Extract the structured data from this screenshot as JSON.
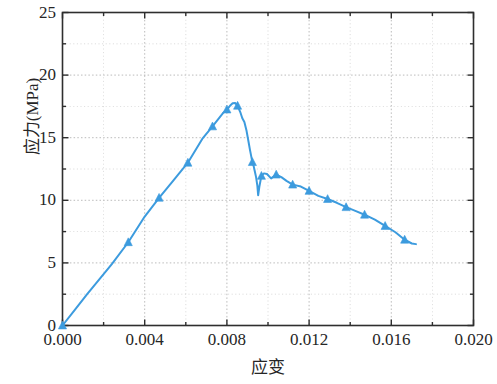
{
  "chart_data": {
    "type": "line",
    "title": "",
    "xlabel": "应变",
    "ylabel": "应力(MPa)",
    "xlim": [
      0.0,
      0.02
    ],
    "ylim": [
      0,
      25
    ],
    "xticks": [
      "0.000",
      "0.004",
      "0.008",
      "0.012",
      "0.016",
      "0.020"
    ],
    "xtick_values": [
      0.0,
      0.004,
      0.008,
      0.012,
      0.016,
      0.02
    ],
    "x_minor_step": 0.002,
    "yticks": [
      "0",
      "5",
      "10",
      "15",
      "20",
      "25"
    ],
    "ytick_values": [
      0,
      5,
      10,
      15,
      20,
      25
    ],
    "y_minor_step": 2.5,
    "grid": true,
    "grid_style": "dotted",
    "grid_color": "#a8a8a8",
    "legend": null,
    "series": [
      {
        "name": "应力-应变曲线",
        "color": "#3c9bde",
        "marker": "triangle",
        "line_width": 2,
        "x": [
          0.0,
          0.0006,
          0.0012,
          0.0018,
          0.0024,
          0.0032,
          0.004,
          0.0047,
          0.0054,
          0.0061,
          0.0068,
          0.0073,
          0.0078,
          0.008,
          0.00815,
          0.00828,
          0.0084,
          0.00852,
          0.00865,
          0.00875,
          0.00885,
          0.00895,
          0.00905,
          0.00912,
          0.00918,
          0.00924,
          0.0093,
          0.00936,
          0.00942,
          0.00948,
          0.00952,
          0.00958,
          0.00968,
          0.0098,
          0.00995,
          0.01015,
          0.0104,
          0.01065,
          0.0109,
          0.0112,
          0.0116,
          0.012,
          0.01245,
          0.0129,
          0.01335,
          0.0138,
          0.01425,
          0.0147,
          0.0152,
          0.0157,
          0.0162,
          0.01665,
          0.017,
          0.0172
        ],
        "y": [
          0.0,
          1.25,
          2.5,
          3.7,
          4.9,
          6.65,
          8.7,
          10.2,
          11.6,
          13.0,
          14.9,
          15.9,
          16.95,
          17.25,
          17.55,
          17.75,
          17.78,
          17.55,
          17.05,
          16.55,
          16.25,
          15.6,
          14.7,
          14.05,
          13.55,
          13.05,
          12.75,
          12.3,
          11.85,
          11.2,
          10.4,
          11.1,
          11.95,
          12.15,
          12.1,
          11.75,
          12.05,
          11.85,
          11.55,
          11.25,
          11.1,
          10.75,
          10.35,
          10.1,
          9.8,
          9.45,
          9.15,
          8.85,
          8.45,
          7.95,
          7.45,
          6.85,
          6.55,
          6.5
        ]
      }
    ],
    "marker_points": {
      "x": [
        0.0,
        0.0032,
        0.0047,
        0.0061,
        0.0073,
        0.008,
        0.00852,
        0.00924,
        0.00968,
        0.0104,
        0.0112,
        0.012,
        0.0129,
        0.0138,
        0.0147,
        0.0157,
        0.01665
      ],
      "y": [
        0.0,
        6.65,
        10.2,
        13.0,
        15.9,
        17.25,
        17.55,
        13.05,
        11.95,
        12.05,
        11.25,
        10.75,
        10.1,
        9.45,
        8.85,
        7.95,
        6.85
      ]
    }
  }
}
